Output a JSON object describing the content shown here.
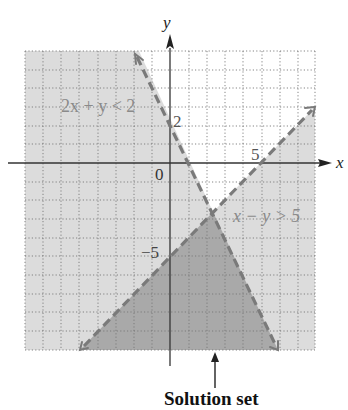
{
  "figure": {
    "axes": {
      "x_label": "x",
      "y_label": "y",
      "origin_label": "0",
      "tick_labels": {
        "x_5": "5",
        "y_2": "2",
        "y_neg5": "−5"
      },
      "xlim": [
        -8,
        8
      ],
      "ylim": [
        -10,
        6
      ],
      "grid": "dotted, 1 unit"
    },
    "inequalities": [
      {
        "label": "2x + y < 2",
        "boundary": "2x + y = 2",
        "style": "dashed"
      },
      {
        "label": "x − y > 5",
        "boundary": "x − y = 5",
        "style": "dashed"
      }
    ],
    "annotation": "Solution set",
    "colors": {
      "light_shade": "#dcdcdc",
      "dark_shade": "#a9a9a9",
      "boundary": "#7a7a7a",
      "label": "#8a8a8a",
      "axis": "#333333"
    }
  }
}
